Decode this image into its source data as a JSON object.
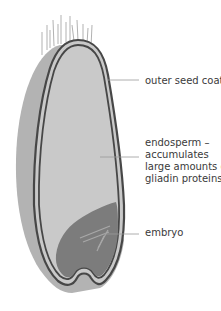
{
  "diagram": {
    "labels": {
      "outer_seed_coat": "outer seed coat",
      "endosperm": {
        "line1": "endosperm –",
        "line2": "accumulates",
        "line3": "large amounts of",
        "line4": "gliadin proteins"
      },
      "embryo": "embryo"
    },
    "colors": {
      "background": "#ffffff",
      "outer_grain": "#b9b9b9",
      "endosperm": "#c8c8c8",
      "seed_coat_line": "#4a4a4a",
      "embryo": "#7f7f7f",
      "hairs": "#8a8a8a",
      "leader_lines": "#9a9a9a",
      "text": "#3a3a3a"
    }
  }
}
